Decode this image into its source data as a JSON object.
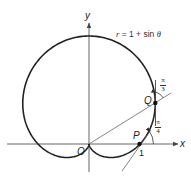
{
  "figure": {
    "curve_equation": "r = 1 + sin θ",
    "curve_equation_parts": {
      "var": "r",
      "rest": " = 1 + sin ",
      "theta": "θ"
    },
    "axes": {
      "x_label": "x",
      "y_label": "y",
      "origin_label": "O"
    },
    "points": [
      {
        "label": "P",
        "polar_theta": "0",
        "x": 1,
        "y": 0,
        "tick_label": "1"
      },
      {
        "label": "Q",
        "polar_theta": "π/6",
        "x": 1.299,
        "y": 0.75
      }
    ],
    "angles": [
      {
        "at": "P",
        "numerator": "π",
        "denominator": "4",
        "meaning": "tangent line angle with x-axis"
      },
      {
        "at": "Q",
        "numerator": "π",
        "denominator": "3",
        "meaning": "angle between radius OQ and vertical tangent"
      }
    ],
    "colors": {
      "curve": "#222222",
      "axis": "#555555",
      "line": "#666666",
      "point": "#111111",
      "background": "#ffffff"
    }
  },
  "geometry": {
    "origin_px": [
      89,
      144
    ],
    "scale_x": 51,
    "scale_y": 54
  }
}
